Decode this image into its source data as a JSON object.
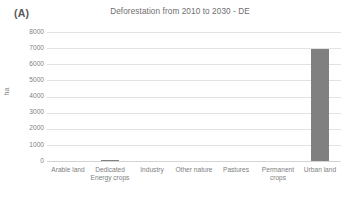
{
  "panel": {
    "label": "(A)"
  },
  "chart_data": {
    "type": "bar",
    "title": "Deforestation from 2010 to 2030 - DE",
    "xlabel": "",
    "ylabel": "ha",
    "categories": [
      "Arable land",
      "Dedicated Energy crops",
      "Industry",
      "Other nature",
      "Pastures",
      "Permanent crops",
      "Urban land"
    ],
    "values": [
      0,
      60,
      0,
      0,
      0,
      0,
      6950
    ],
    "ylim": [
      0,
      8000
    ],
    "ytick_labels": [
      "8000",
      "7000",
      "6000",
      "5000",
      "4000",
      "3000",
      "2000",
      "1000",
      "0"
    ],
    "ytick_values": [
      8000,
      7000,
      6000,
      5000,
      4000,
      3000,
      2000,
      1000,
      0
    ],
    "grid": true,
    "legend": false,
    "bar_color": "#808080",
    "gridline_color": "#e2e2e2",
    "text_color": "#808080"
  }
}
